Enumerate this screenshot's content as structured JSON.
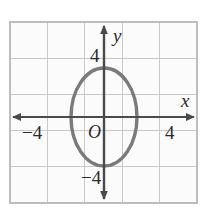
{
  "figure": {
    "kind": "coordinate-grid-with-ellipse",
    "background_color": "#ffffff",
    "plot_background_color": "#fbfbfb",
    "grid_color": "#c9c9c9",
    "grid_border_color": "#bdbdbd",
    "axis_color": "#4a4a4a",
    "curve_color": "#7a7a7a",
    "text_color": "#2b2b2b"
  },
  "grid": {
    "left": 10,
    "top": 22,
    "right": 197,
    "bottom": 203,
    "columns": 5,
    "rows": 5,
    "vertical_lines": [
      10,
      47.4,
      84.8,
      122.2,
      159.6,
      197
    ],
    "horizontal_lines": [
      22,
      58.2,
      94.4,
      130.6,
      166.8,
      203
    ]
  },
  "axes": {
    "x_axis": {
      "name": "x",
      "y_pixel": 117,
      "x_start": 13,
      "x_end": 194,
      "label_x": 181,
      "label_y": 107
    },
    "y_axis": {
      "name": "y",
      "x_pixel": 104,
      "y_start": 26,
      "y_end": 199,
      "label_x": 113,
      "label_y": 42
    },
    "origin_label": "O",
    "origin_label_x": 88,
    "origin_label_y": 138,
    "unit_pixels_x": 18.7,
    "unit_pixels_y": 18.1
  },
  "tick_labels": [
    {
      "text": "4",
      "axis": "y",
      "value": 4,
      "x": 90,
      "y": 62
    },
    {
      "text": "−4",
      "axis": "y",
      "value": -4,
      "x": 81,
      "y": 184
    },
    {
      "text": "−4",
      "axis": "x",
      "value": -4,
      "x": 22,
      "y": 139
    },
    {
      "text": "4",
      "axis": "x",
      "value": 4,
      "x": 165,
      "y": 139
    }
  ],
  "chart_data": {
    "type": "scatter",
    "title": "",
    "xlabel": "x",
    "ylabel": "y",
    "xlim": [
      -5,
      5
    ],
    "ylim": [
      -5,
      5
    ],
    "grid": true,
    "legend": null,
    "curves": [
      {
        "name": "ellipse",
        "shape": "ellipse",
        "center": [
          0,
          0
        ],
        "semi_axis_x": 1.8,
        "semi_axis_y": 2.7,
        "center_px": [
          104,
          117
        ],
        "radius_px": [
          33,
          49
        ],
        "stroke": "#7a7a7a",
        "stroke_width_px": 3.4,
        "fill": "none"
      }
    ],
    "xticks": [
      -4,
      4
    ],
    "yticks": [
      -4,
      4
    ],
    "xtick_labels": [
      "−4",
      "4"
    ],
    "ytick_labels": [
      "−4",
      "4"
    ]
  }
}
